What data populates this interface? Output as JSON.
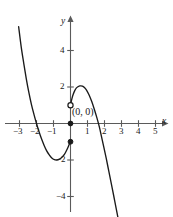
{
  "chart_data": {
    "type": "line",
    "title": "",
    "xlabel": "x",
    "ylabel": "y",
    "grid": false,
    "legend": null,
    "xlim": [
      -3.6,
      5.9
    ],
    "ylim": [
      -5.0,
      5.4
    ],
    "x_ticks": [
      {
        "value": -3,
        "label": "−3"
      },
      {
        "value": -2,
        "label": "−2"
      },
      {
        "value": -1,
        "label": "−1"
      },
      {
        "value": 1,
        "label": "1"
      },
      {
        "value": 2,
        "label": "2"
      },
      {
        "value": 3,
        "label": "3"
      },
      {
        "value": 4,
        "label": "4"
      },
      {
        "value": 5,
        "label": "5"
      }
    ],
    "y_ticks": [
      {
        "value": 4,
        "label": "4"
      },
      {
        "value": 2,
        "label": "2"
      },
      {
        "value": -2,
        "label": "−2"
      },
      {
        "value": -4,
        "label": "−4"
      }
    ],
    "annotations": [
      {
        "text": "(0, 0)",
        "x": 0,
        "y": 0,
        "placement": "right-above"
      }
    ],
    "markers": [
      {
        "x": 0,
        "y": 1,
        "style": "open",
        "label": "open-circle-upper"
      },
      {
        "x": 0,
        "y": 0,
        "style": "filled",
        "label": "filled-dot-origin"
      },
      {
        "x": 0,
        "y": -1,
        "style": "filled",
        "label": "filled-dot-lower"
      }
    ],
    "curve_features": {
      "left_branch_zero": -2.0,
      "local_minimum": {
        "x": -0.8,
        "y": -2.0
      },
      "local_maximum": {
        "x": 0.7,
        "y": 2.05
      },
      "right_branch_zero": 1.8,
      "discontinuity_at_x": 0
    },
    "series": [
      {
        "name": "left-branch",
        "points": [
          [
            -3.05,
            5.3
          ],
          [
            -2.9,
            4.2
          ],
          [
            -2.75,
            3.3
          ],
          [
            -2.6,
            2.45
          ],
          [
            -2.45,
            1.7
          ],
          [
            -2.3,
            1.05
          ],
          [
            -2.15,
            0.5
          ],
          [
            -2.0,
            0.0
          ],
          [
            -1.85,
            -0.45
          ],
          [
            -1.7,
            -0.85
          ],
          [
            -1.55,
            -1.2
          ],
          [
            -1.4,
            -1.5
          ],
          [
            -1.25,
            -1.72
          ],
          [
            -1.1,
            -1.89
          ],
          [
            -0.95,
            -1.98
          ],
          [
            -0.8,
            -2.0
          ],
          [
            -0.65,
            -1.95
          ],
          [
            -0.5,
            -1.85
          ],
          [
            -0.35,
            -1.68
          ],
          [
            -0.22,
            -1.45
          ],
          [
            -0.12,
            -1.25
          ],
          [
            -0.05,
            -1.08
          ],
          [
            0.0,
            -1.0
          ]
        ]
      },
      {
        "name": "right-branch",
        "points": [
          [
            0.0,
            1.0
          ],
          [
            0.08,
            1.35
          ],
          [
            0.16,
            1.6
          ],
          [
            0.25,
            1.8
          ],
          [
            0.35,
            1.95
          ],
          [
            0.45,
            2.02
          ],
          [
            0.55,
            2.06
          ],
          [
            0.7,
            2.05
          ],
          [
            0.82,
            1.97
          ],
          [
            0.95,
            1.82
          ],
          [
            1.1,
            1.55
          ],
          [
            1.25,
            1.2
          ],
          [
            1.4,
            0.78
          ],
          [
            1.55,
            0.32
          ],
          [
            1.7,
            -0.2
          ],
          [
            1.82,
            -0.7
          ],
          [
            1.95,
            -1.25
          ],
          [
            2.1,
            -1.9
          ],
          [
            2.25,
            -2.6
          ],
          [
            2.4,
            -3.3
          ],
          [
            2.55,
            -4.0
          ],
          [
            2.7,
            -4.72
          ],
          [
            2.8,
            -5.2
          ]
        ]
      }
    ],
    "colors": {
      "curve": "#1a1a1a",
      "axis": "#5a5a5a",
      "text": "#1a1a1a",
      "background": "#ffffff"
    }
  },
  "labels": {
    "x_axis_name": "x",
    "y_axis_name": "y",
    "origin_point": "(0, 0)",
    "x_tick_neg3": "−3",
    "x_tick_neg2": "−2",
    "x_tick_neg1": "−1",
    "x_tick_1": "1",
    "x_tick_2": "2",
    "x_tick_3": "3",
    "x_tick_4": "4",
    "x_tick_5": "5",
    "y_tick_4": "4",
    "y_tick_2": "2",
    "y_tick_neg2": "−2",
    "y_tick_neg4": "−4"
  }
}
